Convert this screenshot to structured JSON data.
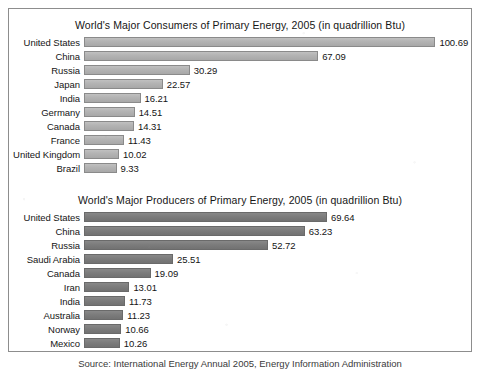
{
  "source_note": "Source: International Energy Annual 2005, Energy Information Administration",
  "units": "quadrillion Btu",
  "scale_px_per_unit": 3.49,
  "colors": {
    "panel_border": "#8d8d8d",
    "consumers_bar": "#b0b0b0",
    "consumers_bar_edge": "#8a8a8a",
    "producers_bar": "#7c7c7c",
    "producers_bar_edge": "#6a6a6a",
    "text": "#151515",
    "page_background": "#ffffff"
  },
  "chart_data": [
    {
      "type": "bar",
      "orientation": "horizontal",
      "title": "World's Major Consumers of Primary Energy, 2005 (in quadrillion Btu)",
      "xlabel": "",
      "ylabel": "",
      "unit": "quadrillion Btu",
      "year": 2005,
      "grid": false,
      "legend": "none",
      "data_labels": true,
      "xlim": [
        0,
        100.69
      ],
      "categories": [
        "United States",
        "China",
        "Russia",
        "Japan",
        "India",
        "Germany",
        "Canada",
        "France",
        "United Kingdom",
        "Brazil"
      ],
      "values": [
        100.69,
        67.09,
        30.29,
        22.57,
        16.21,
        14.51,
        14.31,
        11.43,
        10.02,
        9.33
      ],
      "value_labels": [
        "100.69",
        "67.09",
        "30.29",
        "22.57",
        "16.21",
        "14.51",
        "14.31",
        "11.43",
        "10.02",
        "9.33"
      ]
    },
    {
      "type": "bar",
      "orientation": "horizontal",
      "title": "World's Major Producers of Primary Energy, 2005 (in quadrillion Btu)",
      "xlabel": "",
      "ylabel": "",
      "unit": "quadrillion Btu",
      "year": 2005,
      "grid": false,
      "legend": "none",
      "data_labels": true,
      "xlim": [
        0,
        69.64
      ],
      "categories": [
        "United States",
        "China",
        "Russia",
        "Saudi Arabia",
        "Canada",
        "Iran",
        "India",
        "Australia",
        "Norway",
        "Mexico"
      ],
      "values": [
        69.64,
        63.23,
        52.72,
        25.51,
        19.09,
        13.01,
        11.73,
        11.23,
        10.66,
        10.26
      ],
      "value_labels": [
        "69.64",
        "63.23",
        "52.72",
        "25.51",
        "19.09",
        "13.01",
        "11.73",
        "11.23",
        "10.66",
        "10.26"
      ]
    }
  ]
}
